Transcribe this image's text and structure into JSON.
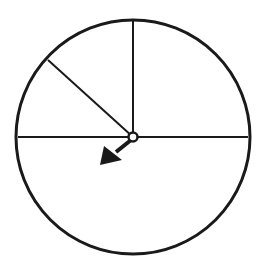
{
  "diagram": {
    "type": "spinner",
    "center": [
      133,
      137
    ],
    "radius": 117,
    "stroke_color": "#1a1a1a",
    "background_color": "#ffffff",
    "sections": [
      {
        "name": "upper-right-quarter",
        "fraction": "1/4"
      },
      {
        "name": "upper-left-small",
        "fraction": "1/8"
      },
      {
        "name": "upper-left-large",
        "fraction": "1/8"
      },
      {
        "name": "bottom-half",
        "fraction": "1/2"
      }
    ],
    "divider_lines": [
      {
        "from": [
          133,
          137
        ],
        "to": [
          133,
          20
        ]
      },
      {
        "from": [
          18,
          137
        ],
        "to": [
          248,
          137
        ]
      },
      {
        "from": [
          133,
          137
        ],
        "to": [
          48,
          60
        ]
      }
    ],
    "arrow": {
      "direction": "down-left",
      "points_to_section": "bottom-half"
    }
  }
}
